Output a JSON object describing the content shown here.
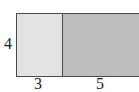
{
  "diagram": {
    "type": "area-model-rectangle",
    "height_label": "4",
    "widths": [
      {
        "label": "3",
        "fill": "#e3e3e3"
      },
      {
        "label": "5",
        "fill": "#bdbdbd"
      }
    ],
    "border_color": "#4a4a4a"
  }
}
